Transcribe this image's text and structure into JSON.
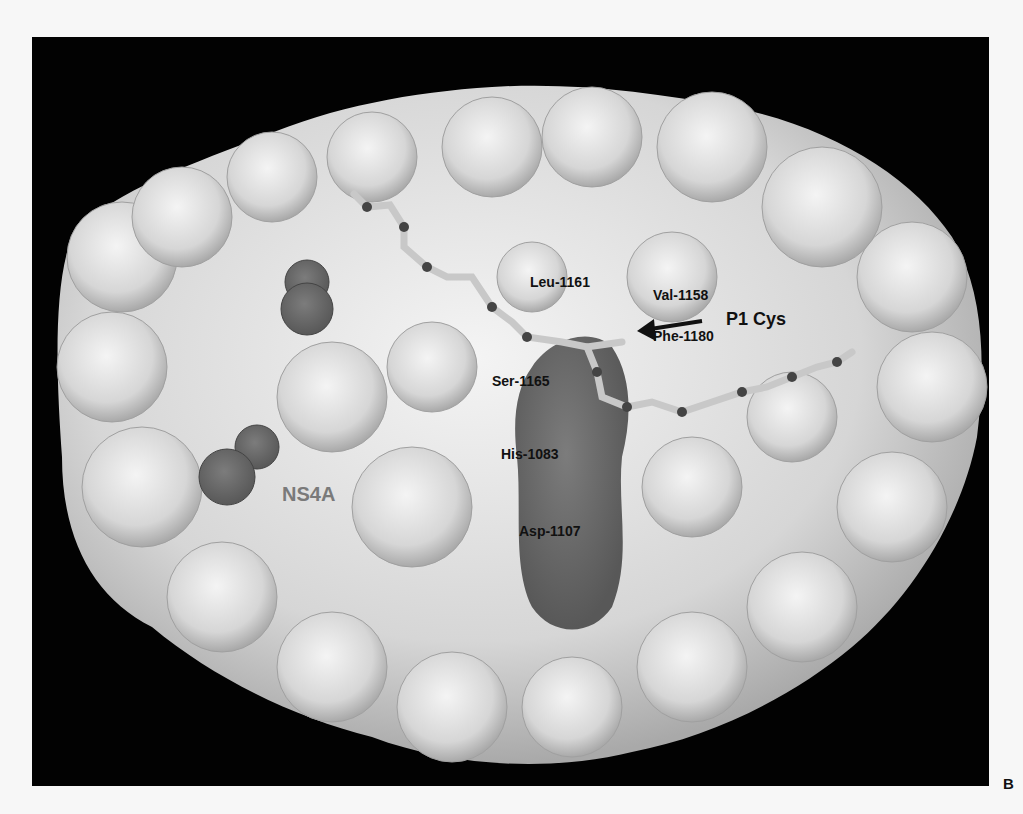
{
  "figure": {
    "panel_letter": "B",
    "background_color": "#020202",
    "surface_color": "#d8d8d8",
    "highlight_color": "#6e6e6e",
    "labels": {
      "leu": "Leu-1161",
      "val": "Val-1158",
      "p1": "P1 Cys",
      "phe": "Phe-1180",
      "ser": "Ser-1165",
      "his": "His-1083",
      "asp": "Asp-1107",
      "ns4a": "NS4A"
    }
  }
}
